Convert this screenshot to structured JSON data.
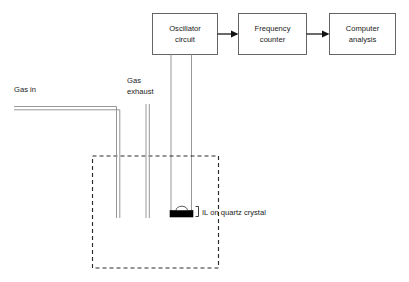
{
  "diagram": {
    "colors": {
      "background": "#ffffff",
      "box_stroke": "#565656",
      "flow_arrow": "#111111",
      "tube": "#8c8c8c",
      "chamber_dashed": "#2b2b2b",
      "crystal_fill": "#000000"
    },
    "blocks": [
      {
        "id": "oscillator",
        "label_line1": "Oscillator",
        "label_line2": "circuit"
      },
      {
        "id": "counter",
        "label_line1": "Frequency",
        "label_line2": "counter"
      },
      {
        "id": "computer",
        "label_line1": "Computer",
        "label_line2": "analysis"
      }
    ],
    "labels": {
      "gas_in": "Gas in",
      "gas_exhaust_line1": "Gas",
      "gas_exhaust_line2": "exhaust",
      "crystal": "IL on quartz crystal"
    }
  }
}
